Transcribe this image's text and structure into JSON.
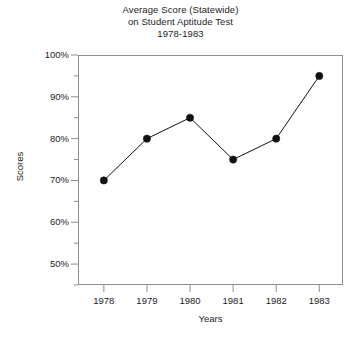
{
  "chart_data": {
    "type": "line",
    "title": "Average Score (Statewide) on Student Aptitude Test 1978-1983",
    "title_lines": [
      "Average Score (Statewide)",
      "on Student Aptitude Test",
      "1978-1983"
    ],
    "xlabel": "Years",
    "ylabel": "Scores",
    "categories": [
      "1978",
      "1979",
      "1980",
      "1981",
      "1982",
      "1983"
    ],
    "values": [
      70,
      80,
      85,
      75,
      80,
      95
    ],
    "ylim": [
      45,
      100
    ],
    "ytick_values": [
      50,
      60,
      70,
      80,
      90,
      100
    ],
    "ytick_labels": [
      "50%",
      "60%",
      "70%",
      "80%",
      "90%",
      "100%"
    ],
    "yminor_values": [
      45,
      55,
      65,
      75,
      85,
      95
    ],
    "grid": false,
    "legend": false,
    "marker": "filled-circle",
    "series_color": "#111111",
    "axis_color": "#8e8e8e",
    "points": [
      {
        "x": "1978",
        "y": 70,
        "label": "70%"
      },
      {
        "x": "1979",
        "y": 80,
        "label": "80%"
      },
      {
        "x": "1980",
        "y": 85,
        "label": "85%"
      },
      {
        "x": "1981",
        "y": 75,
        "label": "75%"
      },
      {
        "x": "1982",
        "y": 80,
        "label": "80%"
      },
      {
        "x": "1983",
        "y": 95,
        "label": "95%"
      }
    ]
  }
}
